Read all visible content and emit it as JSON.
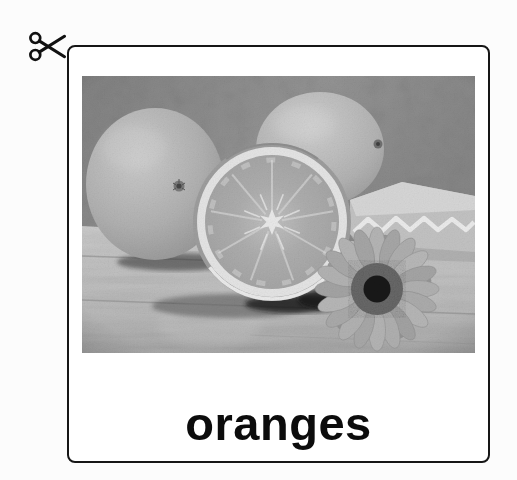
{
  "page": {
    "background": "#fcfcfc"
  },
  "icons": {
    "scissors_label": "scissors cut-out marker",
    "scissors_glyph": "✂"
  },
  "card": {
    "word": "oranges",
    "background": "#ffffff",
    "border_color": "#161616",
    "word_color": "#0c0c0c"
  },
  "photo": {
    "alt": "Grayscale photograph of two whole oranges, a halved orange, an orange wedge and a gerbera daisy on a wooden table",
    "monochrome": true,
    "palette": {
      "wall": "#8d8d8d",
      "wood": "#bcbcbc",
      "fruit": "#b3b3b3",
      "pith": "#e4e4e4",
      "flesh": "#a8a8a8",
      "daisy_center": "#161616",
      "shadow": "#222222"
    }
  }
}
